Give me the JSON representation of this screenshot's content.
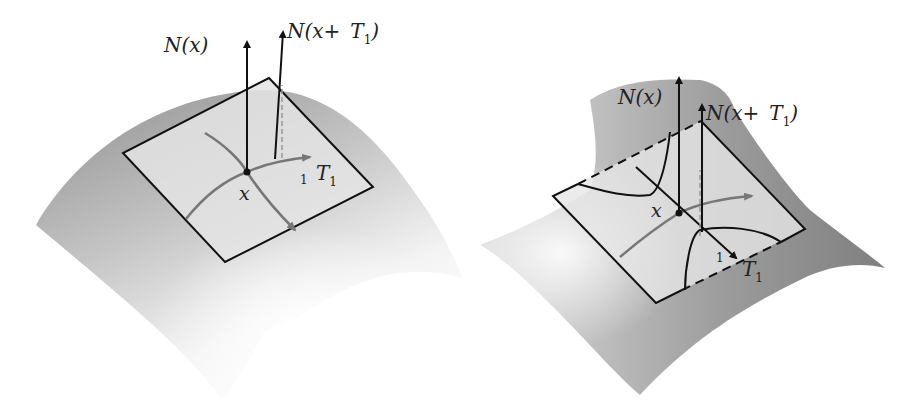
{
  "figure": {
    "left_panel": {
      "description": "convex (elliptic) surface with tangent plane",
      "labels": {
        "normal_at_x": "N(x)",
        "normal_at_shift_prefix": "N(x+",
        "normal_at_shift_T": "T",
        "normal_at_shift_sub": "1",
        "normal_at_shift_suffix": ")",
        "point": "x",
        "tangent": "T",
        "tangent_sub": "1",
        "epsilon_like_mark": "1"
      }
    },
    "right_panel": {
      "description": "saddle (hyperbolic) surface with tangent plane",
      "labels": {
        "normal_at_x": "N(x)",
        "normal_at_shift_prefix": "N(x+",
        "normal_at_shift_T": "T",
        "normal_at_shift_sub": "1",
        "normal_at_shift_suffix": ")",
        "point": "x",
        "tangent": "T",
        "tangent_sub": "1",
        "epsilon_like_mark": "1"
      }
    },
    "colors": {
      "surface_dark": "#9a9a9a",
      "surface_light": "#f2f2f2",
      "plane_fill": "#e2e2e2",
      "line": "#111111",
      "curve_gray": "#777777"
    }
  }
}
